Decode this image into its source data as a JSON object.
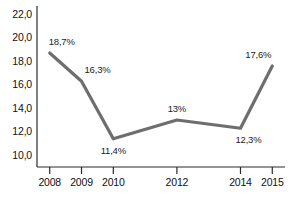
{
  "chart_data": {
    "type": "line",
    "title": "",
    "subtitle": "",
    "xlabel": "",
    "ylabel": "",
    "categories": [
      "2008",
      "2009",
      "2010",
      "2012",
      "2014",
      "2015"
    ],
    "x": [
      2008,
      2009,
      2010,
      2012,
      2014,
      2015
    ],
    "values": [
      18.7,
      16.3,
      11.4,
      13.0,
      12.3,
      17.6
    ],
    "point_labels": [
      "18,7%",
      "16,3%",
      "11,4%",
      "13%",
      "12,3%",
      "17,6%"
    ],
    "label_positions": [
      "above",
      "above",
      "below",
      "above",
      "below",
      "above"
    ],
    "ylim": [
      9.0,
      22.7
    ],
    "y_ticks": [
      10.0,
      12.0,
      14.0,
      16.0,
      18.0,
      20.0,
      22.0
    ],
    "y_tick_labels": [
      "10,0",
      "12,0",
      "14,0",
      "16,0",
      "18,0",
      "20,0",
      "22,0"
    ],
    "xlim": [
      2007.6,
      2015.4
    ],
    "grid": false,
    "legend": false,
    "legend_position": "none",
    "series": [
      {
        "name": "",
        "values": [
          18.7,
          16.3,
          11.4,
          13.0,
          12.3,
          17.6
        ],
        "color": "#6e6e6e"
      }
    ],
    "colors": {
      "line": "#6e6e6e",
      "axis": "#2b2b2b",
      "text": "#1a1a1a",
      "background": "#ffffff"
    }
  }
}
